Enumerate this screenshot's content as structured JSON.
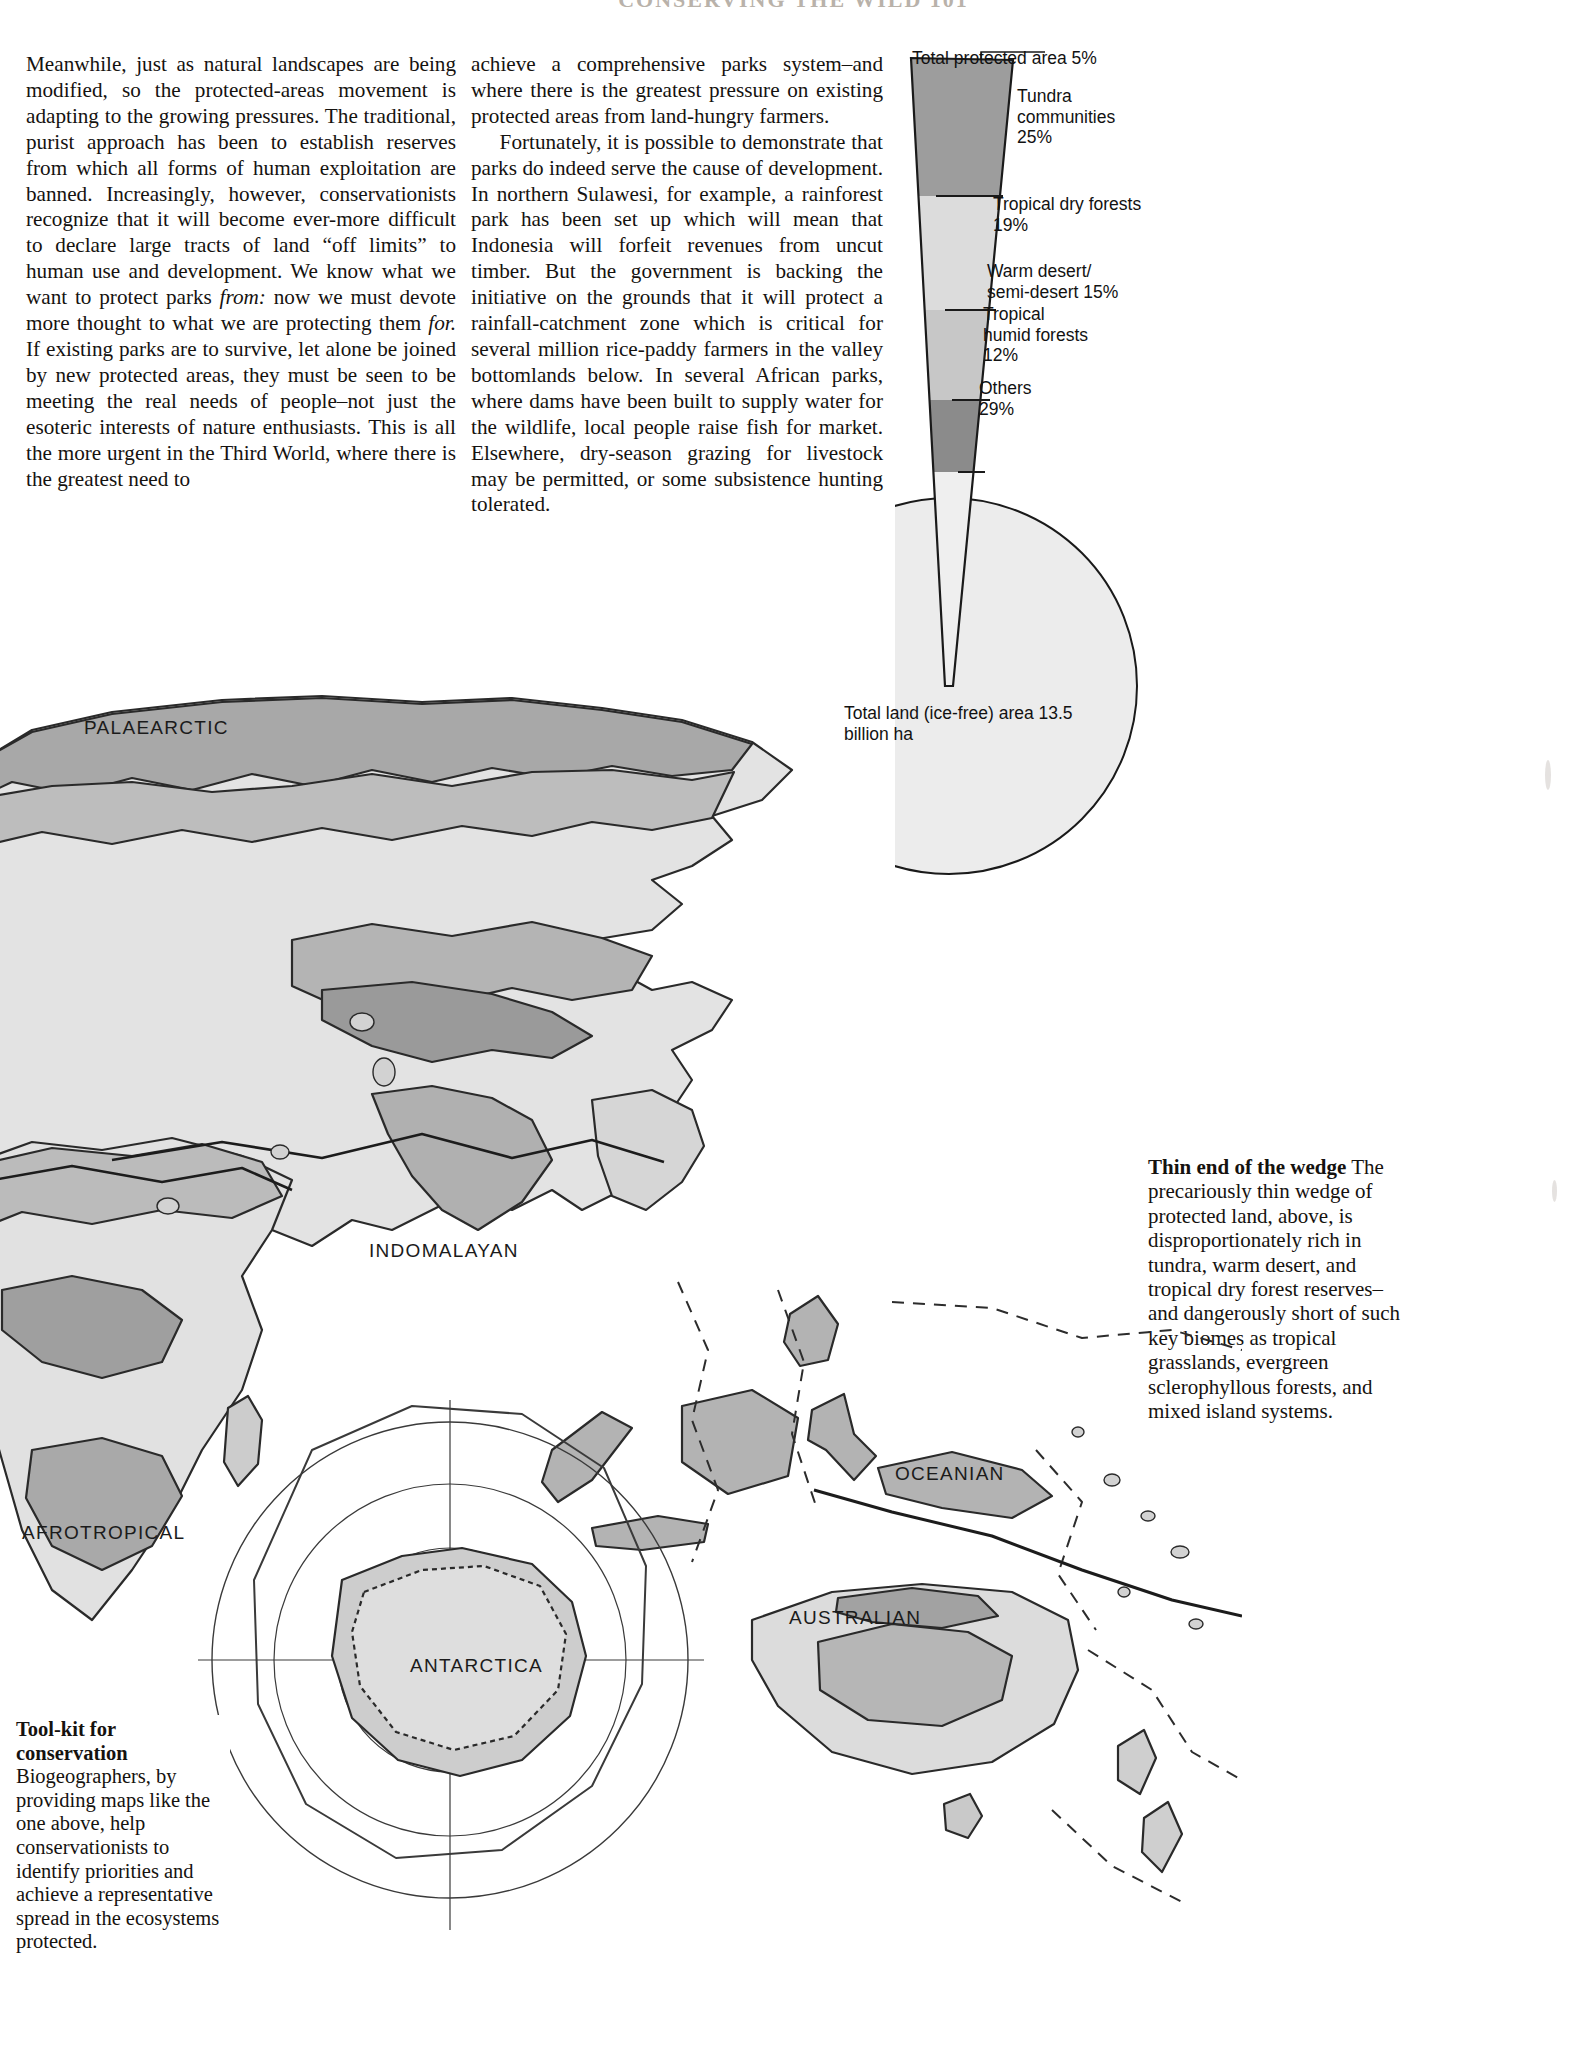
{
  "running_head": "CONSERVING THE WILD 101",
  "body_text": {
    "column_1": [
      "Meanwhile, just as natural landscapes are being modified, so the protected-areas movement is adapting to the growing pressures. The traditional, purist approach has been to establish reserves from which all forms of human exploitation are banned. Increasingly, however, conservationists recognize that it will become ever-more difficult to declare large tracts of land “off limits” to human use and development. We know what we want to protect parks <em>from:</em> now we must devote more thought to what we are protecting them <em>for.</em> If existing parks are to survive, let alone be joined by new protected areas, they must be seen to be meeting the real needs of people–not just the esoteric interests of nature enthusiasts. This is all the more urgent in the Third World, where there is the greatest need to"
    ],
    "column_2": [
      "achieve a comprehensive parks system–and where there is the greatest pressure on existing protected areas from land-hungry farmers.",
      "Fortunately, it is possible to demonstrate that parks do indeed serve the cause of development. In northern Sulawesi, for example, a rainforest park has been set up which will mean that Indonesia will forfeit revenues from uncut timber. But the government is backing the initiative on the grounds that it will protect a rainfall-catchment zone which is critical for several million rice-paddy farmers in the valley bottomlands below. In several African parks, where dams have been built to supply water for the wildlife, local people raise fish for market. Elsewhere, dry-season grazing for livestock may be permitted, or some subsistence hunting tolerated."
    ]
  },
  "chart_data": {
    "type": "pie",
    "title": "Thin end of the wedge",
    "total_label": "Total protected area 5%",
    "whole_label": "Total land (ice-free) area 13.5\nbillion ha",
    "categories": [
      "Tundra communities",
      "Tropical dry forests",
      "Warm desert/semi-desert",
      "Tropical humid forests",
      "Others"
    ],
    "values": [
      25,
      19,
      15,
      12,
      29
    ],
    "unit": "%",
    "wedge_fraction_of_whole": 5,
    "whole_value": 13.5,
    "whole_unit": "billion ha",
    "labels": [
      "Tundra\ncommunities\n25%",
      "Tropical dry forests\n19%",
      "Warm desert/\nsemi-desert 15%",
      "Tropical\nhumid forests\n12%",
      "Others\n29%"
    ],
    "colors": [
      "#9b9b9b",
      "#d9d9d9",
      "#c6c6c6",
      "#8a8a8a",
      "#ececec"
    ],
    "legend": "none",
    "grid": false
  },
  "captions": {
    "wedge": {
      "heading": "Thin end of the wedge",
      "body": "The precariously thin wedge of protected land, above, is disproportionately rich in tundra, warm desert, and tropical dry forest reserves–and dangerously short of such key biomes as tropical grasslands, evergreen sclerophyllous forests, and mixed island systems."
    },
    "map": {
      "heading": "Tool-kit for conservation",
      "body": "Biogeographers, by providing maps like the one above, help conservationists to identify priorities and achieve a representative spread in the ecosystems protected."
    }
  },
  "map": {
    "regions": [
      {
        "name": "PALAEARCTIC"
      },
      {
        "name": "INDOMALAYAN"
      },
      {
        "name": "AFROTROPICAL"
      },
      {
        "name": "OCEANIAN"
      },
      {
        "name": "AUSTRALIAN"
      },
      {
        "name": "ANTARCTICA"
      }
    ]
  }
}
